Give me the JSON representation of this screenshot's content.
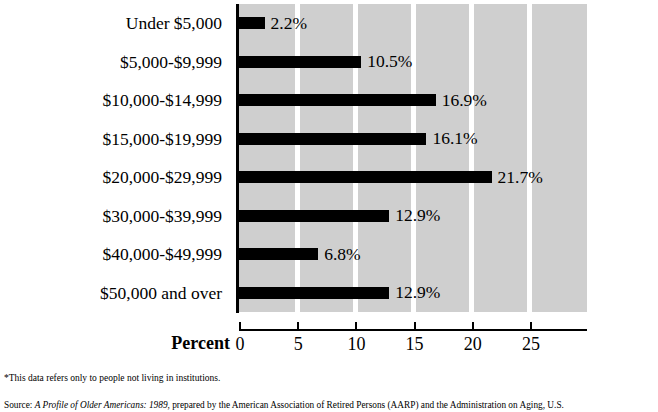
{
  "chart_data": {
    "type": "bar",
    "orientation": "horizontal",
    "title": "",
    "xlabel": "Percent",
    "ylabel": "",
    "xlim": [
      0,
      29.9
    ],
    "grid": true,
    "legend": "none",
    "categories": [
      "Under $5,000",
      "$5,000-$9,999",
      "$10,000-$14,999",
      "$15,000-$19,999",
      "$20,000-$29,999",
      "$30,000-$39,999",
      "$40,000-$49,999",
      "$50,000 and over"
    ],
    "values": [
      2.2,
      10.5,
      16.9,
      16.1,
      21.7,
      12.9,
      6.8,
      12.9
    ],
    "value_labels": [
      "2.2%",
      "10.5%",
      "16.9%",
      "16.1%",
      "21.7%",
      "12.9%",
      "6.8%",
      "12.9%"
    ],
    "xticks": [
      0,
      5,
      10,
      15,
      20,
      25
    ],
    "xtick_labels": [
      "0",
      "5",
      "10",
      "15",
      "20",
      "25"
    ],
    "bar_color": "#000000",
    "plot_background": "#cfcfcf",
    "gridline_color": "#ffffff"
  },
  "notes": {
    "footnote": "*This data refers only to people not living in institutions.",
    "source_label": "Source: ",
    "source_title": "A Profile of Older Americans: 1989",
    "source_rest": ", prepared by the American Association of Retired Persons (AARP) and the Administration on Aging, U.S."
  }
}
